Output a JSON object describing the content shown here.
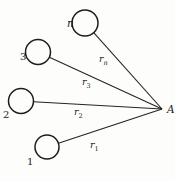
{
  "diagram": {
    "background_color": "#fdfdfc",
    "ink_color": "#1c1c1c",
    "apex": {
      "label": "A"
    },
    "nodes": [
      {
        "id": "node-n",
        "label": "n"
      },
      {
        "id": "node-3",
        "label": "3"
      },
      {
        "id": "node-2",
        "label": "2"
      },
      {
        "id": "node-1",
        "label": "1"
      }
    ],
    "edges": [
      {
        "id": "edge-n-A",
        "label_main": "r",
        "label_sub": "n"
      },
      {
        "id": "edge-3-A",
        "label_main": "r",
        "label_sub": "3"
      },
      {
        "id": "edge-2-A",
        "label_main": "r",
        "label_sub": "2"
      },
      {
        "id": "edge-1-A",
        "label_main": "r",
        "label_sub": "1"
      }
    ]
  }
}
